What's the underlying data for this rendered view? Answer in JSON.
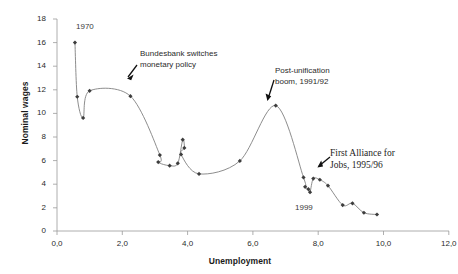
{
  "chart_data": {
    "type": "line",
    "title": "",
    "xlabel": "Unemployment",
    "ylabel": "Nominal wages",
    "xlim": [
      0,
      12
    ],
    "ylim": [
      0,
      18
    ],
    "xticks": [
      "0,0",
      "2,0",
      "4,0",
      "6,0",
      "8,0",
      "10,0",
      "12,0"
    ],
    "xtick_values": [
      0,
      2,
      4,
      6,
      8,
      10,
      12
    ],
    "yticks": [
      "0",
      "2",
      "4",
      "6",
      "8",
      "10",
      "12",
      "14",
      "16",
      "18"
    ],
    "ytick_values": [
      0,
      2,
      4,
      6,
      8,
      10,
      12,
      14,
      16,
      18
    ],
    "grid": false,
    "legend": false,
    "marker": "filled-diamond",
    "line_color": "#808080",
    "marker_color": "#3d3d3d",
    "series": [
      {
        "name": "Nominal wages vs unemployment (Germany, 1970-1999)",
        "points": [
          {
            "x": 0.55,
            "y": 16.0
          },
          {
            "x": 0.62,
            "y": 11.4
          },
          {
            "x": 0.8,
            "y": 9.6
          },
          {
            "x": 1.0,
            "y": 11.9
          },
          {
            "x": 2.25,
            "y": 11.45
          },
          {
            "x": 3.15,
            "y": 6.45
          },
          {
            "x": 3.1,
            "y": 5.85
          },
          {
            "x": 3.45,
            "y": 5.55
          },
          {
            "x": 3.7,
            "y": 5.75
          },
          {
            "x": 3.85,
            "y": 7.75
          },
          {
            "x": 3.9,
            "y": 7.05
          },
          {
            "x": 3.8,
            "y": 6.5
          },
          {
            "x": 4.35,
            "y": 4.85
          },
          {
            "x": 5.6,
            "y": 5.95
          },
          {
            "x": 6.7,
            "y": 10.65
          },
          {
            "x": 7.55,
            "y": 4.55
          },
          {
            "x": 7.6,
            "y": 3.75
          },
          {
            "x": 7.7,
            "y": 3.55
          },
          {
            "x": 7.75,
            "y": 3.3
          },
          {
            "x": 7.85,
            "y": 4.45
          },
          {
            "x": 8.05,
            "y": 4.35
          },
          {
            "x": 8.3,
            "y": 3.85
          },
          {
            "x": 8.75,
            "y": 2.2
          },
          {
            "x": 9.05,
            "y": 2.35
          },
          {
            "x": 9.4,
            "y": 1.55
          },
          {
            "x": 9.8,
            "y": 1.4
          }
        ]
      }
    ],
    "annotations": [
      {
        "name": "year-1970",
        "text": "1970",
        "x": 0.95,
        "y": 17.0
      },
      {
        "name": "bundesbank-note",
        "line1": "Bundesbank switches",
        "line2": "monetary policy",
        "target_x": 2.25,
        "target_y": 11.45
      },
      {
        "name": "post-unification-note",
        "line1": "Post-unification",
        "line2": "boom, 1991/92",
        "target_x": 6.7,
        "target_y": 10.65
      },
      {
        "name": "alliance-note",
        "line1": "First Alliance for",
        "line2": "Jobs, 1995/96",
        "target_x": 8.05,
        "target_y": 4.35
      },
      {
        "name": "year-1999",
        "text": "1999",
        "x": 8.0,
        "y": 1.0
      }
    ]
  },
  "axes": {
    "x_title": "Unemployment",
    "y_title": "Nominal wages"
  },
  "ticks": {
    "y": [
      "18",
      "16",
      "14",
      "12",
      "10",
      "8",
      "6",
      "4",
      "2",
      "0"
    ],
    "x": [
      "0,0",
      "2,0",
      "4,0",
      "6,0",
      "8,0",
      "10,0",
      "12,0"
    ]
  },
  "labels": {
    "year_1970": "1970",
    "year_1999": "1999",
    "bundesbank_l1": "Bundesbank switches",
    "bundesbank_l2": "monetary policy",
    "boom_l1": "Post-unification",
    "boom_l2": "boom, 1991/92",
    "alliance_l1": "First Alliance for",
    "alliance_l2": "Jobs, 1995/96"
  },
  "colors": {
    "line": "#808080",
    "marker": "#3d3d3d",
    "axis": "#9a9a9a",
    "text": "#2b2b2b"
  }
}
